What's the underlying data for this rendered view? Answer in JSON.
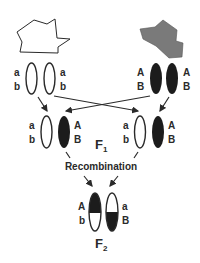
{
  "diagram": {
    "parents": {
      "left": {
        "shape": "white-irregular-polygon",
        "genotype": {
          "top": "a",
          "bottom": "b"
        },
        "labels_left": [
          "a",
          "b"
        ],
        "labels_right": [
          "a",
          "b"
        ]
      },
      "right": {
        "shape": "gray-irregular-polygon",
        "genotype": {
          "top": "A",
          "bottom": "B"
        },
        "labels_left": [
          "A",
          "B"
        ],
        "labels_right": [
          "A",
          "B"
        ]
      }
    },
    "f1": {
      "label": "F",
      "subscript": "1",
      "left_pair": {
        "labels_left": [
          "a",
          "b"
        ],
        "labels_right": [
          "A",
          "B"
        ]
      },
      "right_pair": {
        "labels_left": [
          "a",
          "b"
        ],
        "labels_right": [
          "A",
          "B"
        ]
      }
    },
    "recombination_label": "Recombination",
    "f2": {
      "label": "F",
      "subscript": "2",
      "labels_left": [
        "A",
        "b"
      ],
      "labels_right": [
        "a",
        "B"
      ]
    },
    "colors": {
      "outline": "#2a2a2a",
      "dark_chromosome": "#1c1c1c",
      "gray_parent": "#7a7a7a",
      "background": "#ffffff"
    }
  }
}
